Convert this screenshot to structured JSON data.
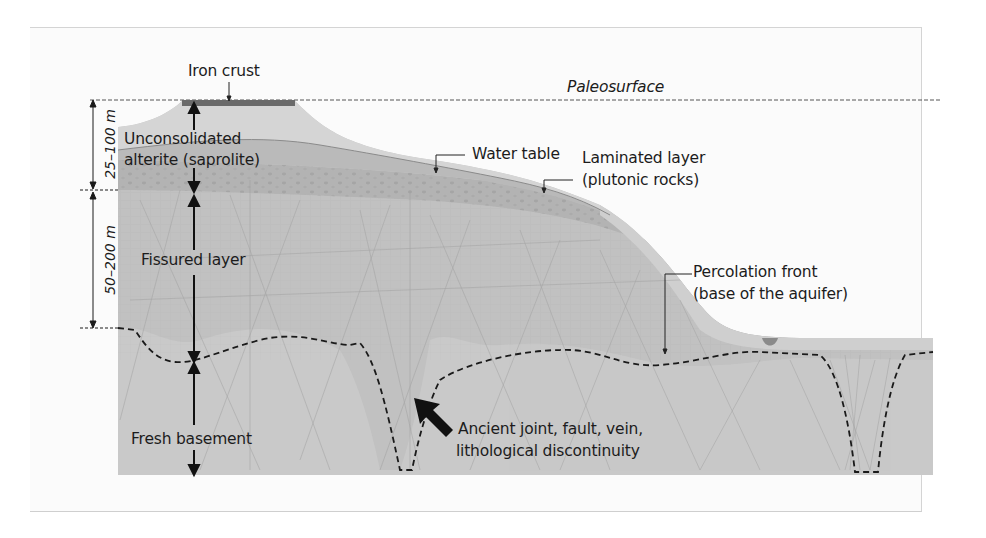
{
  "figure": {
    "type": "geological cross-section",
    "labels": {
      "iron_crust": "Iron crust",
      "paleosurface": "Paleosurface",
      "saprolite_line1": "Unconsolidated",
      "saprolite_line2": "alterite (saprolite)",
      "water_table": "Water table",
      "laminated_line1": "Laminated layer",
      "laminated_line2": "(plutonic rocks)",
      "fissured": "Fissured layer",
      "percolation_line1": "Percolation front",
      "percolation_line2": "(base of the aquifer)",
      "fresh_basement": "Fresh basement",
      "ancient_line1": "Ancient joint, fault, vein,",
      "ancient_line2": "lithological discontinuity"
    },
    "scale": {
      "upper": "25–100 m",
      "lower": "50–200 m"
    },
    "layers": [
      {
        "name": "Iron crust",
        "color": "#6a6a6a"
      },
      {
        "name": "Unconsolidated alterite (saprolite)",
        "color": "#d2d2d2"
      },
      {
        "name": "Saturated saprolite (below water table)",
        "color": "#b9b9b9"
      },
      {
        "name": "Laminated layer",
        "color": "#b2b2b2"
      },
      {
        "name": "Fissured layer",
        "color": "#c4c4c4"
      },
      {
        "name": "Fresh basement",
        "color": "#c8c8c8"
      }
    ]
  }
}
